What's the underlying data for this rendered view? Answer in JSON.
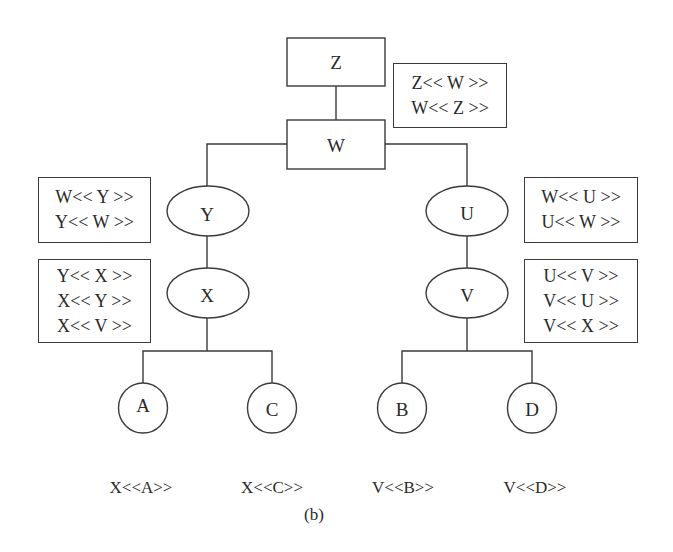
{
  "diagram": {
    "caption": "(b)",
    "colors": {
      "stroke": "#3a3a3a",
      "text": "#2a2a2a",
      "background": "#ffffff"
    },
    "nodes": {
      "Z": {
        "label": "Z",
        "shape": "rectangle"
      },
      "W": {
        "label": "W",
        "shape": "rectangle"
      },
      "Y": {
        "label": "Y",
        "shape": "ellipse"
      },
      "X": {
        "label": "X",
        "shape": "ellipse"
      },
      "U": {
        "label": "U",
        "shape": "ellipse"
      },
      "V": {
        "label": "V",
        "shape": "ellipse"
      },
      "A": {
        "label": "A",
        "shape": "circle"
      },
      "C": {
        "label": "C",
        "shape": "circle"
      },
      "B": {
        "label": "B",
        "shape": "circle"
      },
      "D": {
        "label": "D",
        "shape": "circle"
      }
    },
    "edges": [
      [
        "Z",
        "W"
      ],
      [
        "W",
        "Y"
      ],
      [
        "W",
        "U"
      ],
      [
        "Y",
        "X"
      ],
      [
        "U",
        "V"
      ],
      [
        "X",
        "A"
      ],
      [
        "X",
        "C"
      ],
      [
        "V",
        "B"
      ],
      [
        "V",
        "D"
      ]
    ],
    "info_boxes": {
      "ZW": {
        "lines": [
          "Z<< W >>",
          "W<< Z >>"
        ]
      },
      "WY": {
        "lines": [
          "W<< Y >>",
          "Y<< W >>"
        ]
      },
      "YX": {
        "lines": [
          "Y<< X >>",
          "X<< Y >>",
          "X<< V >>"
        ]
      },
      "WU": {
        "lines": [
          "W<< U >>",
          "U<< W >>"
        ]
      },
      "UV": {
        "lines": [
          "U<< V >>",
          "V<< U >>",
          "V<< X >>"
        ]
      }
    },
    "leaf_labels": {
      "A": "X<<A>>",
      "C": "X<<C>>",
      "B": "V<<B>>",
      "D": "V<<D>>"
    }
  }
}
